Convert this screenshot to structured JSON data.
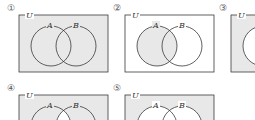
{
  "colors": {
    "shade": "#e8e8e8",
    "stroke": "#3a3a3a",
    "background": "#ffffff"
  },
  "labels": {
    "universe": "U",
    "set_a": "A",
    "set_b": "B"
  },
  "diagrams": [
    {
      "number": "①",
      "shaded": [
        "outside",
        "a_only",
        "intersection",
        "b_only"
      ],
      "description": "U (entire universal set shaded)"
    },
    {
      "number": "②",
      "shaded": [
        "a_only",
        "intersection"
      ],
      "description": "A shaded"
    },
    {
      "number": "③",
      "shaded": [
        "outside"
      ],
      "description": "Region outside circle shaded (partially visible)"
    },
    {
      "number": "④",
      "shaded": [
        "outside",
        "a_only",
        "b_only"
      ],
      "description": "Complement of A∩B shaded"
    },
    {
      "number": "⑤",
      "shaded": [
        "outside"
      ],
      "description": "Complement of A∪B shaded"
    }
  ]
}
